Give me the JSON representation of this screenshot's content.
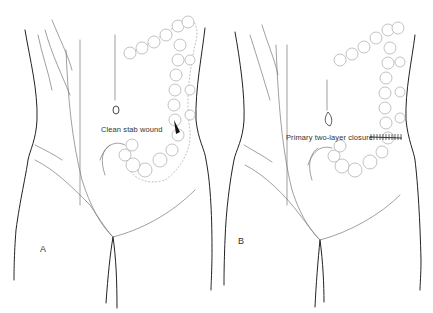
{
  "figure": {
    "panels": [
      {
        "id": "A",
        "letter": "A",
        "callout": "Clean stab wound"
      },
      {
        "id": "B",
        "letter": "B",
        "callout": "Primary two-layer closure"
      }
    ],
    "colors": {
      "line": "#222222",
      "faint_line": "#777777",
      "colon_outline": "#999999",
      "background": "#ffffff"
    }
  }
}
